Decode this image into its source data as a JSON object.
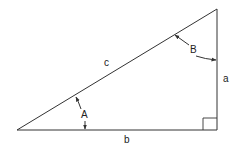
{
  "diagram": {
    "type": "right-triangle",
    "colors": {
      "stroke": "#333333",
      "text": "#222222",
      "background": "#ffffff"
    },
    "vertices": {
      "bottom_left": [
        17,
        130
      ],
      "bottom_right": [
        217,
        130
      ],
      "top_right": [
        217,
        9
      ]
    },
    "sides": {
      "hypotenuse": {
        "label": "c"
      },
      "vertical": {
        "label": "a"
      },
      "base": {
        "label": "b"
      }
    },
    "angles": {
      "A": {
        "label": "A",
        "vertex": "bottom_left"
      },
      "B": {
        "label": "B",
        "vertex": "top_right"
      },
      "right_angle": {
        "vertex": "bottom_right",
        "marker": "square"
      }
    }
  }
}
